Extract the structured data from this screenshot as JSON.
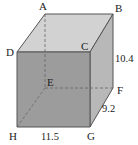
{
  "figure": {
    "type": "rectangular-prism",
    "vertices": {
      "A": {
        "label": "A",
        "x": 45,
        "y": 14
      },
      "B": {
        "label": "B",
        "x": 113,
        "y": 14
      },
      "C": {
        "label": "C",
        "x": 90,
        "y": 52
      },
      "D": {
        "label": "D",
        "x": 17,
        "y": 52
      },
      "E": {
        "label": "E",
        "x": 45,
        "y": 88
      },
      "F": {
        "label": "F",
        "x": 113,
        "y": 88
      },
      "G": {
        "label": "G",
        "x": 90,
        "y": 127
      },
      "H": {
        "label": "H",
        "x": 17,
        "y": 127
      }
    },
    "measurements": {
      "height_CG": "10.4",
      "depth_GF": "9.2",
      "width_HG": "11.5"
    },
    "colors": {
      "front_face": "#9c9c9c",
      "top_face": "#d2d2d2",
      "right_face": "#b8b8b8",
      "edge": "#555555",
      "hidden_edge": "#666666"
    }
  }
}
